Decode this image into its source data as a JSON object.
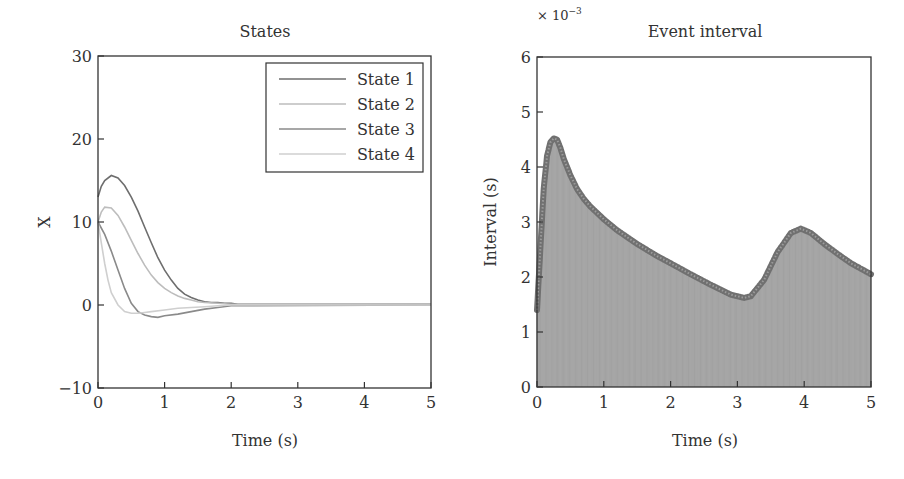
{
  "chart_data": [
    {
      "type": "line",
      "title": "States",
      "xlabel": "Time (s)",
      "ylabel": "X",
      "xlim": [
        0,
        5
      ],
      "ylim": [
        -10,
        30
      ],
      "xticks": [
        0,
        1,
        2,
        3,
        4,
        5
      ],
      "yticks": [
        -10,
        0,
        10,
        20,
        30
      ],
      "grid": false,
      "legend_position": "upper right",
      "series": [
        {
          "name": "State 1",
          "color": "#6e6e6e",
          "x": [
            0,
            0.05,
            0.1,
            0.2,
            0.3,
            0.4,
            0.5,
            0.6,
            0.7,
            0.8,
            0.9,
            1.0,
            1.1,
            1.2,
            1.3,
            1.4,
            1.5,
            1.6,
            1.7,
            1.8,
            1.9,
            2.0,
            2.1,
            5.0
          ],
          "y": [
            13,
            14.3,
            15.0,
            15.6,
            15.3,
            14.4,
            13.0,
            11.3,
            9.4,
            7.5,
            5.7,
            4.2,
            3.0,
            2.0,
            1.3,
            0.9,
            0.6,
            0.4,
            0.3,
            0.3,
            0.2,
            0.2,
            0.1,
            0.1
          ]
        },
        {
          "name": "State 2",
          "color": "#bdbdbd",
          "x": [
            0,
            0.05,
            0.1,
            0.2,
            0.3,
            0.4,
            0.5,
            0.6,
            0.7,
            0.8,
            0.9,
            1.0,
            1.1,
            1.2,
            1.3,
            1.4,
            1.5,
            1.6,
            1.8,
            2.0,
            5.0
          ],
          "y": [
            10,
            11.2,
            11.8,
            11.7,
            10.8,
            9.4,
            7.8,
            6.2,
            4.8,
            3.6,
            2.7,
            2.0,
            1.5,
            1.1,
            0.8,
            0.6,
            0.4,
            0.3,
            0.2,
            0.1,
            0.1
          ]
        },
        {
          "name": "State 3",
          "color": "#8a8a8a",
          "x": [
            0,
            0.1,
            0.2,
            0.3,
            0.4,
            0.5,
            0.6,
            0.7,
            0.8,
            0.9,
            1.0,
            1.2,
            1.4,
            1.6,
            1.8,
            2.0,
            5.0
          ],
          "y": [
            10,
            8.5,
            6.5,
            4.2,
            2.0,
            0.2,
            -0.8,
            -1.2,
            -1.4,
            -1.5,
            -1.3,
            -1.1,
            -0.8,
            -0.5,
            -0.3,
            -0.1,
            0.0
          ]
        },
        {
          "name": "State 4",
          "color": "#cfcfcf",
          "x": [
            0,
            0.05,
            0.1,
            0.15,
            0.2,
            0.3,
            0.4,
            0.5,
            0.6,
            0.7,
            0.8,
            1.0,
            1.2,
            1.4,
            1.6,
            1.8,
            2.0,
            5.0
          ],
          "y": [
            10,
            7.5,
            5.0,
            3.0,
            1.5,
            0.0,
            -0.8,
            -1.0,
            -1.0,
            -0.9,
            -0.8,
            -0.6,
            -0.4,
            -0.3,
            -0.2,
            -0.1,
            0.0,
            0.0
          ]
        }
      ]
    },
    {
      "type": "bar",
      "title": "Event interval",
      "xlabel": "Time (s)",
      "ylabel": "Interval (s)",
      "y_scale_note": "× 10⁻³",
      "xlim": [
        0,
        5
      ],
      "ylim": [
        0,
        6
      ],
      "xticks": [
        0,
        1,
        2,
        3,
        4,
        5
      ],
      "yticks": [
        0,
        1,
        2,
        3,
        4,
        5,
        6
      ],
      "grid": false,
      "series": [
        {
          "name": "Event interval (×10⁻³ s)",
          "color": "#9a9a9a",
          "marker_color": "#707070",
          "x": [
            0,
            0.05,
            0.1,
            0.15,
            0.2,
            0.25,
            0.3,
            0.35,
            0.4,
            0.5,
            0.6,
            0.7,
            0.8,
            1.0,
            1.2,
            1.5,
            1.8,
            2.0,
            2.3,
            2.6,
            2.9,
            3.1,
            3.2,
            3.4,
            3.6,
            3.8,
            3.95,
            4.1,
            4.3,
            4.5,
            4.7,
            5.0
          ],
          "y": [
            1.4,
            2.5,
            3.6,
            4.2,
            4.45,
            4.52,
            4.5,
            4.35,
            4.15,
            3.85,
            3.6,
            3.42,
            3.28,
            3.05,
            2.85,
            2.6,
            2.38,
            2.25,
            2.05,
            1.86,
            1.68,
            1.62,
            1.65,
            1.95,
            2.45,
            2.8,
            2.88,
            2.8,
            2.6,
            2.42,
            2.25,
            2.05
          ]
        }
      ]
    }
  ],
  "left": {
    "title": "States",
    "xlabel": "Time (s)",
    "ylabel": "X",
    "xticks": [
      "0",
      "1",
      "2",
      "3",
      "4",
      "5"
    ],
    "yticks": [
      "−10",
      "0",
      "10",
      "20",
      "30"
    ],
    "legend": [
      "State 1",
      "State 2",
      "State 3",
      "State 4"
    ]
  },
  "right": {
    "title": "Event interval",
    "xlabel": "Time (s)",
    "ylabel": "Interval (s)",
    "multiplier": "× 10",
    "multiplier_exp": "−3",
    "xticks": [
      "0",
      "1",
      "2",
      "3",
      "4",
      "5"
    ],
    "yticks": [
      "0",
      "1",
      "2",
      "3",
      "4",
      "5",
      "6"
    ]
  }
}
